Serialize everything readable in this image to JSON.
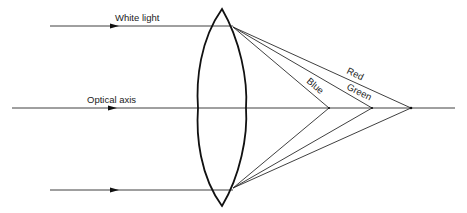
{
  "diagram": {
    "labels": {
      "incoming_ray": "White light",
      "axis": "Optical axis",
      "red": "Red",
      "green": "Green",
      "blue": "Blue"
    },
    "colors": {
      "background": "#ffffff",
      "lines": "#2a2a2a",
      "lens": "#111111",
      "text": "#222222"
    },
    "geometry": {
      "lens": {
        "top": [
          222,
          9
        ],
        "bottom": [
          222,
          206
        ],
        "left_x": 198,
        "right_x": 246
      },
      "rays_y": {
        "top": 26,
        "axis": 108,
        "bottom": 190
      },
      "focal_points_x": {
        "blue": 329,
        "green": 372,
        "red": 411
      },
      "axis_extent": [
        12,
        455
      ],
      "incoming_ray_start_x": 50
    }
  }
}
